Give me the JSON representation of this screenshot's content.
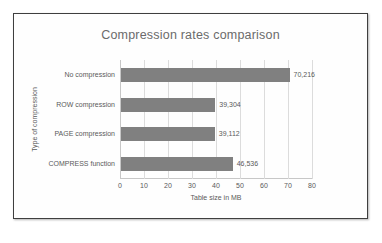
{
  "chart_data": {
    "type": "bar",
    "orientation": "horizontal",
    "title": "Compression rates comparison",
    "xlabel": "Table size in MB",
    "ylabel": "Type of compression",
    "categories": [
      "No compression",
      "ROW compression",
      "PAGE compression",
      "COMPRESS function"
    ],
    "values": [
      70.216,
      39.304,
      39.112,
      46.536
    ],
    "data_labels": [
      "70,216",
      "39,304",
      "39,112",
      "46,536"
    ],
    "xlim": [
      0,
      80
    ],
    "xticks": [
      0,
      10,
      20,
      30,
      40,
      50,
      60,
      70,
      80
    ],
    "xtick_labels": [
      "0",
      "10",
      "20",
      "30",
      "40",
      "50",
      "60",
      "70",
      "80"
    ],
    "grid": "vertical",
    "legend": "none",
    "bar_color": "#808080",
    "text_color": "#5a5a5a",
    "gridline_color": "#dcdcdc",
    "title_color": "#6b6b6b",
    "frame_color": "#3f3f3f",
    "background_color": "#ffffff"
  }
}
